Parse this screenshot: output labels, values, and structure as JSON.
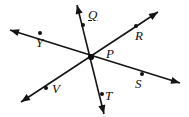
{
  "figure": {
    "type": "geometry-diagram",
    "background_color": "#ffffff",
    "line_color": "#151515",
    "label_color": "#101010",
    "vertex": {
      "name": "P",
      "label": "P",
      "x": 91,
      "y": 57,
      "label_x": 106,
      "label_y": 47
    },
    "labels": [
      {
        "id": "label-q",
        "text": "Q",
        "x": 88,
        "y": 8,
        "underlined": true
      },
      {
        "id": "label-r",
        "text": "R",
        "x": 135,
        "y": 29,
        "underlined": false
      },
      {
        "id": "label-p",
        "text": "P",
        "x": 106,
        "y": 47,
        "underlined": false
      },
      {
        "id": "label-y",
        "text": "Y",
        "x": 36,
        "y": 36,
        "underlined": false
      },
      {
        "id": "label-s",
        "text": "S",
        "x": 135,
        "y": 77,
        "underlined": false
      },
      {
        "id": "label-v",
        "text": "V",
        "x": 52,
        "y": 82,
        "underlined": false
      },
      {
        "id": "label-t",
        "text": "T",
        "x": 105,
        "y": 89,
        "underlined": false
      }
    ],
    "points": [
      {
        "id": "point-q",
        "name": "Q",
        "x": 83,
        "y": 25
      },
      {
        "id": "point-r",
        "name": "R",
        "x": 136,
        "y": 26
      },
      {
        "id": "point-y",
        "name": "Y",
        "x": 40,
        "y": 33
      },
      {
        "id": "point-s",
        "name": "S",
        "x": 142,
        "y": 74
      },
      {
        "id": "point-v",
        "name": "V",
        "x": 46,
        "y": 88
      },
      {
        "id": "point-t",
        "name": "T",
        "x": 102,
        "y": 94
      }
    ],
    "lines": [
      {
        "id": "line-qt",
        "name": "line-Q-T",
        "through": [
          "Q",
          "P",
          "T"
        ],
        "x1": 77,
        "y1": 5,
        "x2": 104,
        "y2": 114
      },
      {
        "id": "line-yrs",
        "name": "line-Y-S",
        "through": [
          "Y",
          "P",
          "S"
        ],
        "x1": 10,
        "y1": 30,
        "x2": 180,
        "y2": 83
      },
      {
        "id": "line-rv",
        "name": "line-R-V",
        "through": [
          "R",
          "P",
          "V"
        ],
        "x1": 158,
        "y1": 12,
        "x2": 21,
        "y2": 102
      }
    ],
    "arrowheads": [
      {
        "id": "arrow-q",
        "name": "arrowhead-up-Q",
        "x": 77,
        "y": 5,
        "angle": 256
      },
      {
        "id": "arrow-t",
        "name": "arrowhead-down-T",
        "x": 104,
        "y": 114,
        "angle": 76
      },
      {
        "id": "arrow-y",
        "name": "arrowhead-upper-left-Y",
        "x": 10,
        "y": 30,
        "angle": 197
      },
      {
        "id": "arrow-s",
        "name": "arrowhead-lower-right-S",
        "x": 180,
        "y": 83,
        "angle": 17
      },
      {
        "id": "arrow-r",
        "name": "arrowhead-upper-right-R",
        "x": 158,
        "y": 12,
        "angle": 327
      },
      {
        "id": "arrow-v",
        "name": "arrowhead-lower-left-V",
        "x": 21,
        "y": 102,
        "angle": 147
      }
    ]
  }
}
